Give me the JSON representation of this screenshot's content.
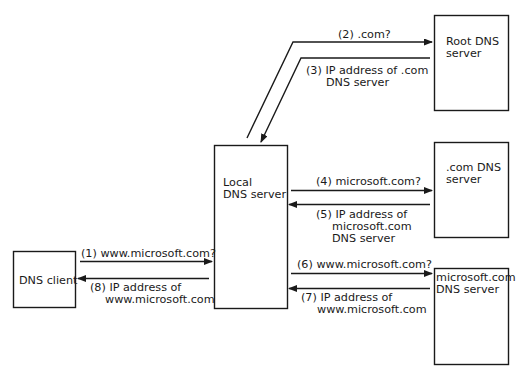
{
  "colors": {
    "stroke": "#1a1a1a",
    "background": "#ffffff"
  },
  "nodes": {
    "client": {
      "lines": [
        "DNS client"
      ]
    },
    "local": {
      "lines": [
        "Local",
        "DNS server"
      ]
    },
    "root": {
      "lines": [
        "Root DNS",
        "server"
      ]
    },
    "com": {
      "lines": [
        ".com DNS",
        "server"
      ]
    },
    "ms": {
      "lines": [
        "microsoft.com",
        "DNS server"
      ]
    }
  },
  "messages": [
    {
      "step": 1,
      "from": "client",
      "to": "local",
      "lines": [
        "(1) www.microsoft.com?"
      ]
    },
    {
      "step": 2,
      "from": "local",
      "to": "root",
      "lines": [
        "(2) .com?"
      ]
    },
    {
      "step": 3,
      "from": "root",
      "to": "local",
      "lines": [
        "(3) IP address of .com",
        "DNS server"
      ]
    },
    {
      "step": 4,
      "from": "local",
      "to": "com",
      "lines": [
        "(4) microsoft.com?"
      ]
    },
    {
      "step": 5,
      "from": "com",
      "to": "local",
      "lines": [
        "(5) IP address of",
        "microsoft.com",
        "DNS server"
      ]
    },
    {
      "step": 6,
      "from": "local",
      "to": "ms",
      "lines": [
        "(6) www.microsoft.com?"
      ]
    },
    {
      "step": 7,
      "from": "ms",
      "to": "local",
      "lines": [
        "(7) IP address of",
        "www.microsoft.com"
      ]
    },
    {
      "step": 8,
      "from": "local",
      "to": "client",
      "lines": [
        "(8) IP address of",
        "www.microsoft.com"
      ]
    }
  ]
}
